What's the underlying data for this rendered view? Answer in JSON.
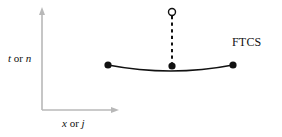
{
  "figure": {
    "scheme_label": "FTCS",
    "axes": {
      "y_label_var1": "t",
      "y_label_conj": " or ",
      "y_label_var2": "n",
      "x_label_var1": "x",
      "x_label_conj": " or ",
      "x_label_var2": "j",
      "axis_color": "#b8b8b8",
      "origin": [
        42,
        110
      ],
      "y_axis_top": [
        42,
        10
      ],
      "x_axis_right": [
        118,
        110
      ]
    },
    "stencil": {
      "type": "diagram",
      "curve_color": "#111111",
      "node_color": "#111111",
      "open_node_fill": "#ffffff",
      "dashed_color": "#111111",
      "known_nodes": [
        {
          "name": "left-node",
          "x": 108,
          "y": 65,
          "filled": true
        },
        {
          "name": "center-node",
          "x": 172,
          "y": 67,
          "filled": true
        },
        {
          "name": "right-node",
          "x": 233,
          "y": 65,
          "filled": true
        }
      ],
      "unknown_nodes": [
        {
          "name": "new-time-level-node",
          "x": 172,
          "y": 12,
          "filled": false
        }
      ],
      "curve_path": "M 108 65 Q 171 77 233 65",
      "dashed_path": "M 172 14 L 172 65"
    }
  }
}
